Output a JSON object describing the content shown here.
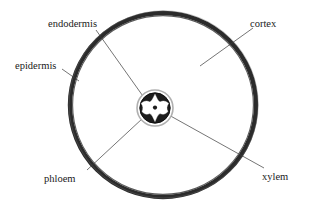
{
  "figure": {
    "title_fragment": "",
    "background_color": "#ffffff",
    "ink_color": "#1a1a1a"
  },
  "labels": {
    "endodermis": "endodermis",
    "cortex": "cortex",
    "epidermis": "epidermis",
    "phloem": "phloem",
    "xylem": "xylem"
  },
  "colors": {
    "outer_ring": "#2b2b2b",
    "outer_ring_inner_shade": "#4a4a4a",
    "stele_ring": "#bdbdbd",
    "stele_fill": "#1c1c1c",
    "xylem_fill": "#ffffff",
    "leader_line": "#3a3a3a",
    "interior_fill": "#ffffff"
  },
  "geometry": {
    "outer_circle": {
      "cx": 163,
      "cy": 105,
      "rx": 93,
      "ry": 92,
      "stroke_width": 4.2
    },
    "stele": {
      "cx": 155,
      "cy": 108,
      "r_outer": 18,
      "r_inner": 15.5,
      "xylem_arm_half_width": 4.2,
      "xylem_arm_length": 13.5
    }
  },
  "leaders": [
    {
      "name": "endodermis-leader",
      "x1": 96,
      "y1": 30,
      "x2": 145,
      "y2": 99
    },
    {
      "name": "cortex-leader",
      "x1": 253,
      "y1": 28,
      "x2": 200,
      "y2": 66
    },
    {
      "name": "epidermis-leader",
      "x1": 62,
      "y1": 69,
      "x2": 78,
      "y2": 80
    },
    {
      "name": "phloem-leader",
      "x1": 87,
      "y1": 170,
      "x2": 143,
      "y2": 118
    },
    {
      "name": "xylem-leader",
      "x1": 264,
      "y1": 168,
      "x2": 167,
      "y2": 114
    }
  ],
  "label_positions": {
    "endodermis": {
      "x": 48,
      "y": 27
    },
    "cortex": {
      "x": 250,
      "y": 27
    },
    "epidermis": {
      "x": 15,
      "y": 69
    },
    "phloem": {
      "x": 44,
      "y": 182
    },
    "xylem": {
      "x": 262,
      "y": 180
    }
  }
}
